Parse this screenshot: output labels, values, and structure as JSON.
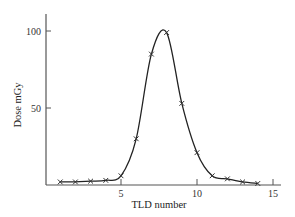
{
  "chart_data": {
    "type": "line",
    "title": "",
    "xlabel": "TLD number",
    "ylabel": "Dose mGy",
    "xlim": [
      0,
      15.5
    ],
    "ylim": [
      0,
      110
    ],
    "x_ticks": [
      5,
      10,
      15
    ],
    "y_ticks": [
      50,
      100
    ],
    "grid": false,
    "legend": null,
    "series": [
      {
        "name": "Measured dose",
        "marker": "x",
        "smooth": true,
        "x": [
          1,
          2,
          3,
          4,
          5,
          6,
          7,
          8,
          9,
          10,
          11,
          12,
          13,
          14
        ],
        "values": [
          2,
          2,
          2.5,
          3,
          6,
          30,
          85,
          99,
          53,
          21,
          6,
          4,
          2,
          1
        ]
      }
    ]
  },
  "colors": {
    "line": "#222222",
    "axis": "#555555",
    "marker": "#333333"
  }
}
